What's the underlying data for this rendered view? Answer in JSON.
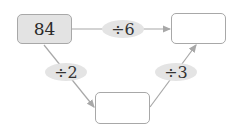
{
  "diagram": {
    "start_box": {
      "value": "84"
    },
    "top_right_box": {
      "value": ""
    },
    "bottom_box": {
      "value": ""
    },
    "operations": {
      "top": {
        "label": "÷6"
      },
      "left": {
        "label": "÷2"
      },
      "right": {
        "label": "÷3"
      }
    },
    "colors": {
      "line": "#a8a8a8",
      "filled_box": "#e3e3e3",
      "oval": "#e4e4e4"
    }
  }
}
